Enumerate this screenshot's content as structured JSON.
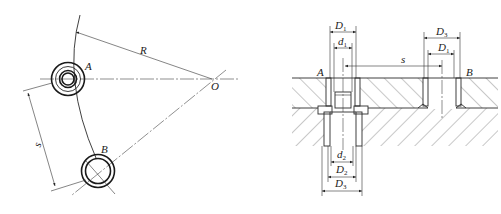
{
  "figure": {
    "left_view": {
      "labels": {
        "point_a": "A",
        "point_b": "B",
        "center": "O",
        "radius": "R",
        "spacing": "s"
      }
    },
    "right_view": {
      "labels": {
        "point_a": "A",
        "point_b": "B",
        "spacing": "s",
        "top_a_outer": {
          "main": "D",
          "sub": "1"
        },
        "top_a_inner": {
          "main": "d",
          "sub": "1"
        },
        "top_b_outer": {
          "main": "D",
          "sub": "3"
        },
        "top_b_inner": {
          "main": "D",
          "sub": "1"
        },
        "bottom_inner": {
          "main": "d",
          "sub": "2"
        },
        "bottom_mid": {
          "main": "D",
          "sub": "2"
        },
        "bottom_outer": {
          "main": "D",
          "sub": "3"
        }
      }
    }
  }
}
